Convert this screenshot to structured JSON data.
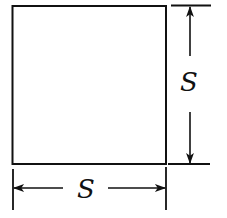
{
  "diagram": {
    "shape": "square",
    "colors": {
      "background": "#ffffff",
      "stroke": "#111111"
    },
    "square": {
      "x": 12,
      "y": 6,
      "width": 154,
      "height": 158
    },
    "dimensions": {
      "horizontal": {
        "label": "S",
        "description": "width of square",
        "y": 188,
        "from_x": 13,
        "to_x": 166
      },
      "vertical": {
        "label": "S",
        "description": "height of square",
        "x": 190,
        "from_y": 6,
        "to_y": 164
      }
    }
  }
}
